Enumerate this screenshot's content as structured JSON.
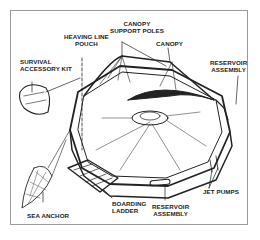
{
  "diagram": {
    "labels": {
      "canopy_support_poles": [
        "CANOPY",
        "SUPPORT POLES"
      ],
      "heaving_line_pouch": [
        "HEAVING LINE",
        "POUCH"
      ],
      "canopy": "CANOPY",
      "survival_accessory_kit": [
        "SURVIVAL",
        "ACCESSORY KIT"
      ],
      "reservoir_assembly_top": [
        "RESERVOIR",
        "ASSEMBLY"
      ],
      "jet_pumps": "JET PUMPS",
      "boarding_ladder": [
        "BOARDING",
        "LADDER"
      ],
      "reservoir_assembly_bottom": [
        "RESERVOIR",
        "ASSEMBLY"
      ],
      "sea_anchor": "SEA ANCHOR"
    },
    "colors": {
      "ink": "#222222",
      "frame": "#9a9a9a",
      "background": "#ffffff"
    }
  }
}
